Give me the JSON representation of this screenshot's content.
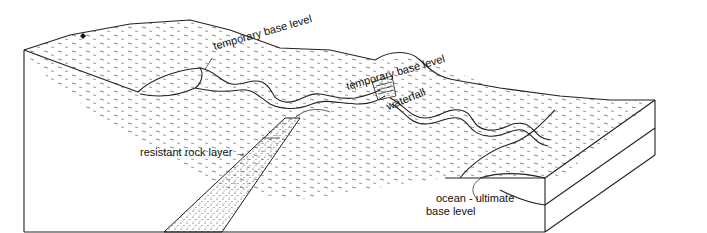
{
  "diagram": {
    "type": "block-diagram",
    "colors": {
      "ink": "#222222",
      "paper": "#ffffff"
    },
    "labels": [
      {
        "id": "temp-base-1",
        "text": "temporary base level"
      },
      {
        "id": "temp-base-2",
        "text": "temporary base level"
      },
      {
        "id": "waterfall",
        "text": "waterfall"
      },
      {
        "id": "resistant-rock",
        "text": "resistant rock layer →"
      },
      {
        "id": "ocean-line1",
        "text": "ocean - ultimate"
      },
      {
        "id": "ocean-line2",
        "text": "base level"
      }
    ]
  }
}
